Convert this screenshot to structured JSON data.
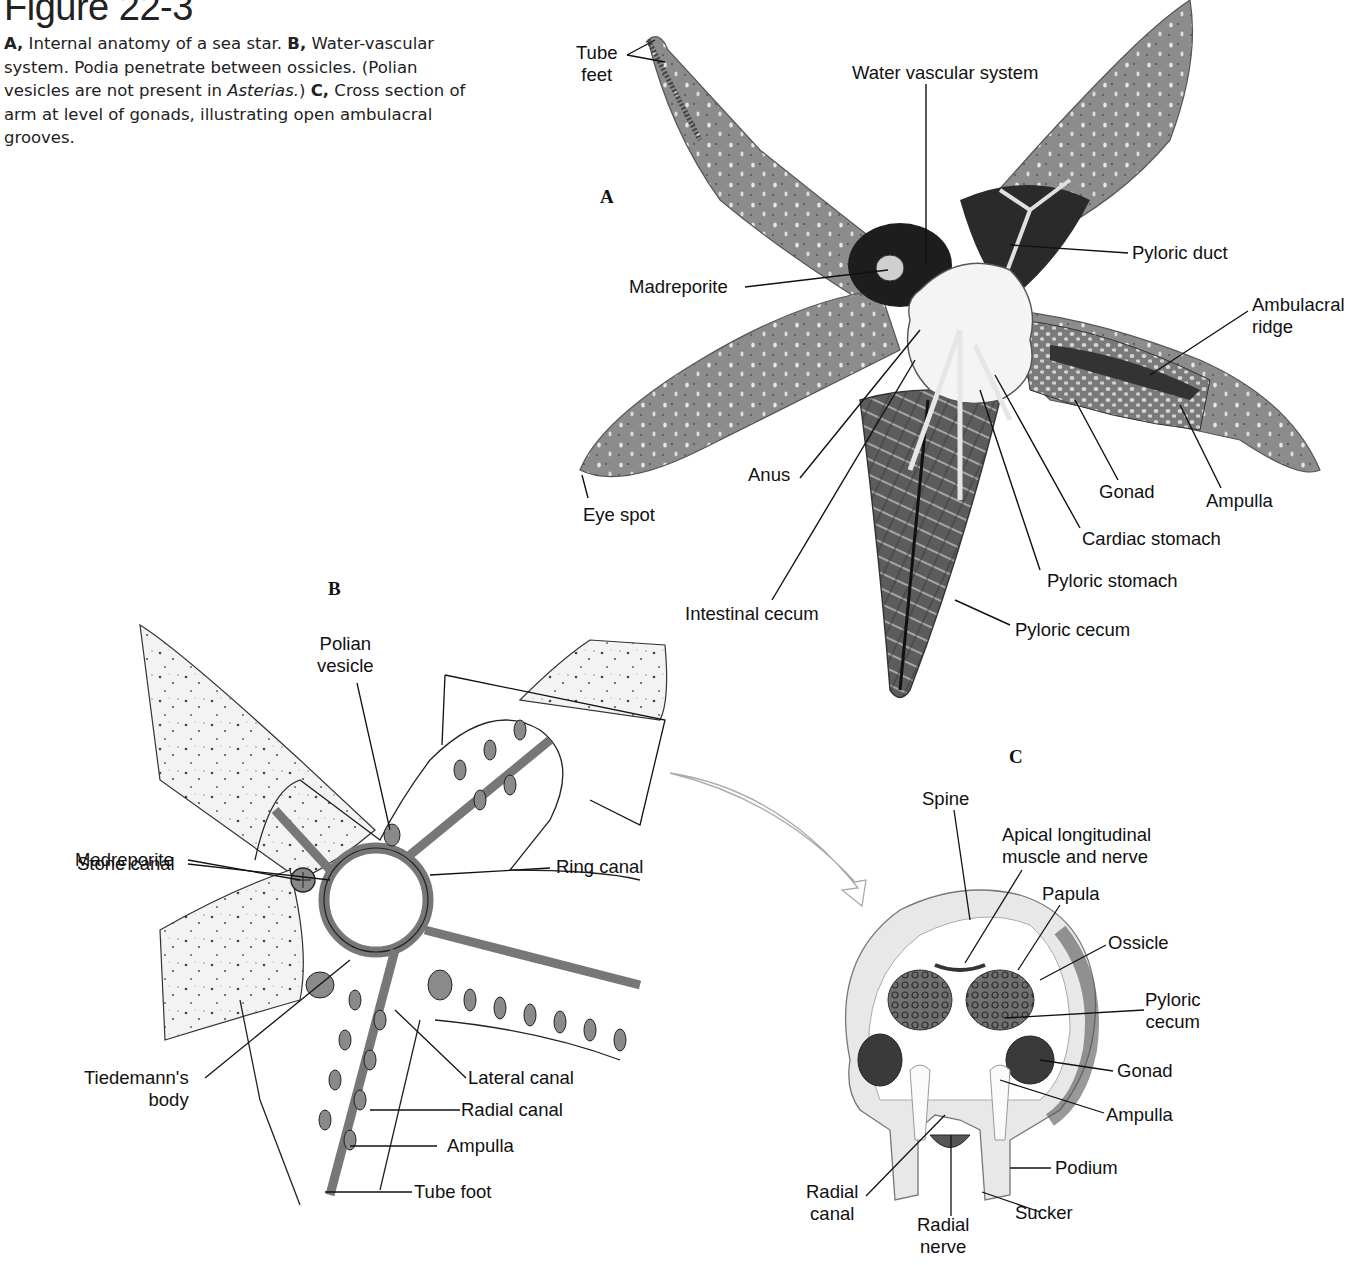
{
  "figure": {
    "title": "Figure 22-3",
    "caption": {
      "a_marker": "A,",
      "a_text": " Internal anatomy of a sea star. ",
      "b_marker": "B,",
      "b_text": " Water-vascular system. Podia penetrate between ossicles. (Polian vesicles are not present in ",
      "genus": "Asterias.",
      "b_text_end": ") ",
      "c_marker": "C,",
      "c_text": " Cross section of arm at level of gonads, illustrating open ambulacral grooves."
    }
  },
  "panels": {
    "a": {
      "letter": "A",
      "labels": {
        "tube_feet_1": "Tube",
        "tube_feet_2": "feet",
        "water_vascular": "Water vascular system",
        "madreporite": "Madreporite",
        "pyloric_duct": "Pyloric duct",
        "ambulacral_1": "Ambulacral",
        "ambulacral_2": "ridge",
        "anus": "Anus",
        "eye_spot": "Eye spot",
        "gonad": "Gonad",
        "ampulla": "Ampulla",
        "cardiac_stomach": "Cardiac stomach",
        "pyloric_stomach": "Pyloric stomach",
        "intestinal_cecum": "Intestinal cecum",
        "pyloric_cecum": "Pyloric cecum"
      }
    },
    "b": {
      "letter": "B",
      "labels": {
        "polian_1": "Polian",
        "polian_2": "vesicle",
        "madreporite": "Madreporite",
        "stone_canal": "Stone canal",
        "ring_canal": "Ring canal",
        "tiedemann_1": "Tiedemann's",
        "tiedemann_2": "body",
        "lateral_canal": "Lateral canal",
        "radial_canal": "Radial canal",
        "ampulla": "Ampulla",
        "tube_foot": "Tube foot"
      }
    },
    "c": {
      "letter": "C",
      "labels": {
        "spine": "Spine",
        "apical_1": "Apical longitudinal",
        "apical_2": "muscle and nerve",
        "papula": "Papula",
        "ossicle": "Ossicle",
        "pyloric_1": "Pyloric",
        "pyloric_2": "cecum",
        "gonad": "Gonad",
        "ampulla": "Ampulla",
        "podium": "Podium",
        "radial_canal_1": "Radial",
        "radial_canal_2": "canal",
        "sucker": "Sucker",
        "radial_nerve_1": "Radial",
        "radial_nerve_2": "nerve"
      }
    }
  },
  "colors": {
    "body_gray": "#8e8e8e",
    "dark_gray": "#3a3a3a",
    "light_gray": "#d8d8d8",
    "line": "#111111",
    "arrow": "#b0b0b0"
  }
}
